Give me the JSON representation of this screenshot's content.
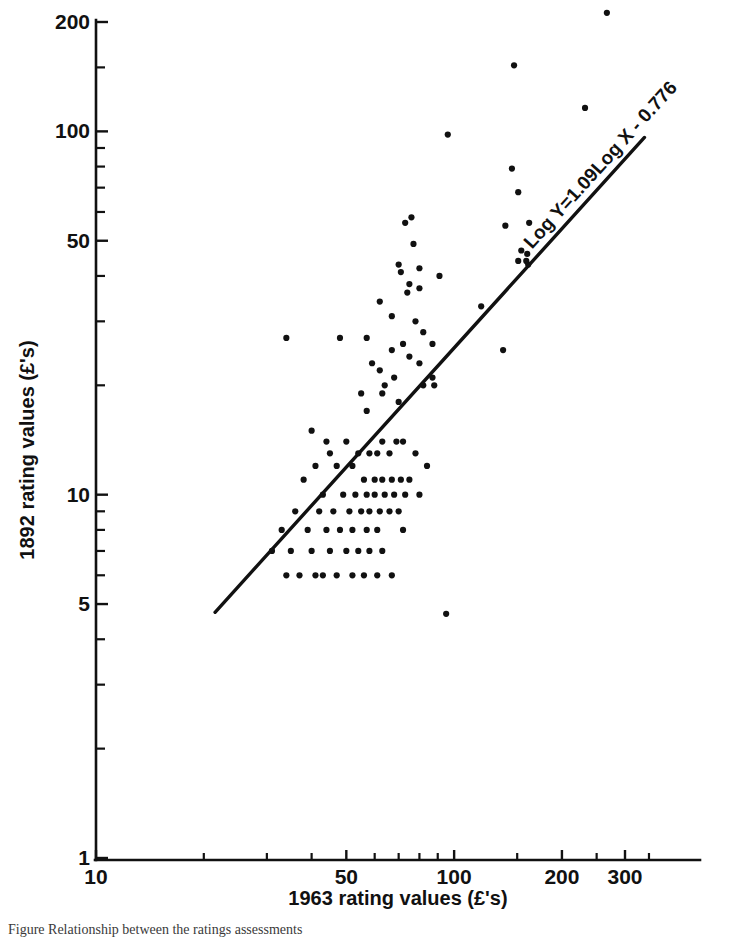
{
  "chart_data": {
    "type": "scatter",
    "title": "",
    "xlabel": "1963 rating values (£'s)",
    "ylabel": "1892 rating values (£'s)",
    "xscale": "log",
    "yscale": "log",
    "xlim": [
      10,
      400
    ],
    "ylim": [
      1,
      230
    ],
    "grid": false,
    "legend": null,
    "xticks": [
      10,
      50,
      100,
      200,
      300
    ],
    "xtick_labels": [
      "10",
      "50",
      "100",
      "200",
      "300"
    ],
    "xminor_ticks": [
      20,
      30,
      40,
      60,
      70,
      80,
      90,
      150,
      250,
      350
    ],
    "yticks": [
      1,
      5,
      10,
      50,
      100,
      200
    ],
    "ytick_labels": [
      "1",
      "5",
      "10",
      "50",
      "100",
      "200"
    ],
    "yminor_ticks": [
      2,
      3,
      4,
      6,
      7,
      8,
      9,
      20,
      30,
      40,
      60,
      70,
      80,
      90,
      150
    ],
    "annotations": [
      {
        "text": "Log Y=1.09Log X - 0.776",
        "kind": "fit-equation",
        "rotation_deg": -49.6
      }
    ],
    "fit_line": {
      "equation": "Log Y=1.09Log X - 0.776",
      "slope": 1.09,
      "intercept": -0.776,
      "x_start": 21.5,
      "x_end": 340.0
    },
    "series": [
      {
        "name": "Parishes",
        "marker": "dot",
        "color": "#111111",
        "points": [
          [
            267,
            212
          ],
          [
            232,
            116
          ],
          [
            147,
            152
          ],
          [
            96,
            98
          ],
          [
            145,
            79
          ],
          [
            151,
            68
          ],
          [
            162,
            56
          ],
          [
            139,
            55
          ],
          [
            76,
            58
          ],
          [
            73,
            56
          ],
          [
            77,
            49
          ],
          [
            154,
            47
          ],
          [
            160,
            46
          ],
          [
            159,
            44
          ],
          [
            151,
            44
          ],
          [
            161,
            43
          ],
          [
            70,
            43
          ],
          [
            80,
            42
          ],
          [
            71,
            41
          ],
          [
            91,
            40
          ],
          [
            75,
            38
          ],
          [
            80,
            37
          ],
          [
            74,
            36
          ],
          [
            119,
            33
          ],
          [
            62,
            34
          ],
          [
            67,
            31
          ],
          [
            78,
            30
          ],
          [
            82,
            28
          ],
          [
            34,
            27
          ],
          [
            48,
            27
          ],
          [
            57,
            27
          ],
          [
            72,
            26
          ],
          [
            87,
            26
          ],
          [
            137,
            25
          ],
          [
            67,
            25
          ],
          [
            75,
            24
          ],
          [
            80,
            23
          ],
          [
            59,
            23
          ],
          [
            62,
            22
          ],
          [
            87,
            21
          ],
          [
            68,
            21
          ],
          [
            82,
            20
          ],
          [
            88,
            20
          ],
          [
            64,
            20
          ],
          [
            55,
            19
          ],
          [
            63,
            19
          ],
          [
            70,
            18
          ],
          [
            57,
            17
          ],
          [
            40,
            15
          ],
          [
            44,
            14
          ],
          [
            50,
            14
          ],
          [
            63,
            14
          ],
          [
            69,
            14
          ],
          [
            72,
            14
          ],
          [
            45,
            13
          ],
          [
            54,
            13
          ],
          [
            58,
            13
          ],
          [
            61,
            13
          ],
          [
            66,
            13
          ],
          [
            78,
            13
          ],
          [
            84,
            12
          ],
          [
            41,
            12
          ],
          [
            47,
            12
          ],
          [
            52,
            12
          ],
          [
            56,
            11
          ],
          [
            60,
            11
          ],
          [
            63,
            11
          ],
          [
            67,
            11
          ],
          [
            71,
            11
          ],
          [
            75,
            11
          ],
          [
            38,
            11
          ],
          [
            43,
            10
          ],
          [
            49,
            10
          ],
          [
            53,
            10
          ],
          [
            57,
            10
          ],
          [
            60,
            10
          ],
          [
            64,
            10
          ],
          [
            68,
            10
          ],
          [
            73,
            10
          ],
          [
            80,
            10
          ],
          [
            36,
            9
          ],
          [
            42,
            9
          ],
          [
            46,
            9
          ],
          [
            51,
            9
          ],
          [
            55,
            9
          ],
          [
            58,
            9
          ],
          [
            62,
            9
          ],
          [
            66,
            9
          ],
          [
            70,
            9
          ],
          [
            33,
            8
          ],
          [
            39,
            8
          ],
          [
            44,
            8
          ],
          [
            48,
            8
          ],
          [
            52,
            8
          ],
          [
            57,
            8
          ],
          [
            61,
            8
          ],
          [
            72,
            8
          ],
          [
            35,
            7
          ],
          [
            40,
            7
          ],
          [
            45,
            7
          ],
          [
            50,
            7
          ],
          [
            54,
            7
          ],
          [
            58,
            7
          ],
          [
            63,
            7
          ],
          [
            31,
            7
          ],
          [
            37,
            6
          ],
          [
            43,
            6
          ],
          [
            47,
            6
          ],
          [
            52,
            6
          ],
          [
            56,
            6
          ],
          [
            61,
            6
          ],
          [
            67,
            6
          ],
          [
            34,
            6
          ],
          [
            41,
            6
          ],
          [
            95,
            4.7
          ]
        ]
      }
    ]
  },
  "axis": {
    "x_title": "1963 rating values (£'s)",
    "y_title": "1892 rating values (£'s)"
  },
  "equation_text": "Log Y=1.09Log X - 0.776",
  "caption": "Figure    Relationship between the ratings assessments"
}
